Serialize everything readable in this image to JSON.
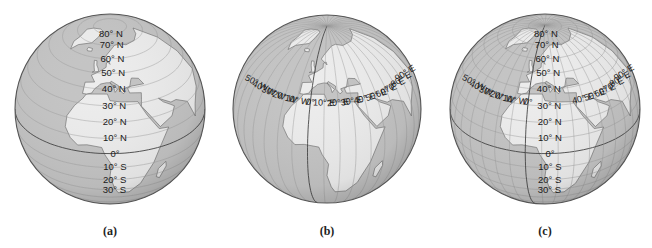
{
  "figure": {
    "panels": [
      {
        "id": "a",
        "caption": "(a)",
        "description": "Globe showing lines of latitude",
        "center": [
          110,
          109
        ],
        "radius": 95,
        "latitude_labels": [
          "80° N",
          "70° N",
          "60° N",
          "50° N",
          "40° N",
          "30° N",
          "20° N",
          "10° N",
          "0°",
          "10° S",
          "20° S",
          "30° S"
        ],
        "longitude_labels": []
      },
      {
        "id": "b",
        "caption": "(b)",
        "description": "Globe showing lines of longitude",
        "center": [
          327,
          109
        ],
        "radius": 94,
        "latitude_labels": [],
        "longitude_labels": [
          "50° W",
          "40° W",
          "30° W",
          "20° W",
          "10° W",
          "0°",
          "10° E",
          "20° E",
          "30° E",
          "40° E",
          "50° E",
          "60° E",
          "70° E",
          "80° E",
          "90° E"
        ]
      },
      {
        "id": "c",
        "caption": "(c)",
        "description": "Globe showing combined latitude and longitude grid",
        "center": [
          545,
          109
        ],
        "radius": 95,
        "latitude_labels": [
          "80° N",
          "70° N",
          "60° N",
          "50° N",
          "40° N",
          "30° N",
          "20° N",
          "10° N",
          "0°",
          "10° S",
          "20° S",
          "30° S"
        ],
        "longitude_labels": [
          "50° W",
          "40° W",
          "30° W",
          "20° W",
          "10° W",
          "0°",
          "40° E",
          "50° E",
          "60° E",
          "70° E",
          "80° E",
          "90° E"
        ]
      }
    ],
    "colors": {
      "land": "#ececec",
      "ocean": "#c4c4c4",
      "grid": "#9a9a9a",
      "outline": "#555555",
      "label": "#1a1a1a"
    }
  }
}
